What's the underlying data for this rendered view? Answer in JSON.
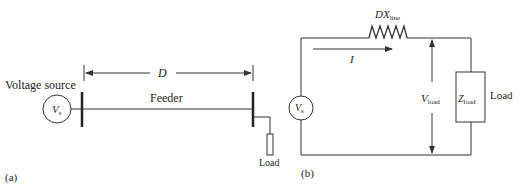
{
  "panel_a": {
    "label": "(a)",
    "source_label": "Voltage source",
    "source_symbol": "V",
    "source_subscript": "s",
    "distance_label": "D",
    "feeder_label": "Feeder",
    "load_label": "Load"
  },
  "panel_b": {
    "label": "(b)",
    "line_reactance_symbol": "DX",
    "line_reactance_subscript": "line",
    "current_label": "I",
    "source_symbol": "V",
    "source_subscript": "s",
    "load_voltage_symbol": "V",
    "load_voltage_subscript": "load",
    "load_impedance_symbol": "Z",
    "load_impedance_subscript": "load",
    "load_label": "Load"
  },
  "colors": {
    "line": "#333333",
    "text": "#222222",
    "background": "#ffffff"
  }
}
